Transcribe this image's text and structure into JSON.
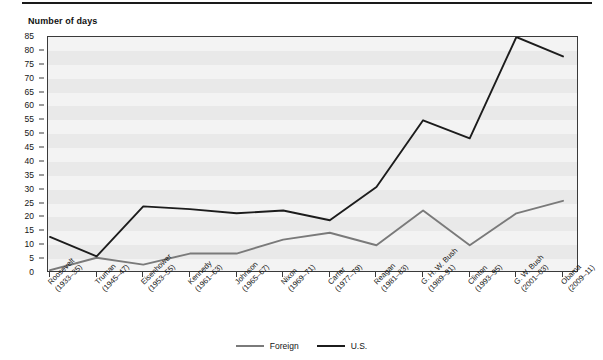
{
  "figure": {
    "y_axis_title": "Number of days"
  },
  "legend": {
    "items": [
      {
        "label": "Foreign",
        "color": "#7a7a7a"
      },
      {
        "label": "U.S.",
        "color": "#1c1c1c"
      }
    ]
  },
  "chart_data": {
    "type": "line",
    "title": "",
    "subtitle": "",
    "xlabel": "",
    "ylabel": "Number of days",
    "ylim": [
      0,
      85
    ],
    "ytick_step": 5,
    "yticks": [
      0,
      5,
      10,
      15,
      20,
      25,
      30,
      35,
      40,
      45,
      50,
      55,
      60,
      65,
      70,
      75,
      80,
      85
    ],
    "ytick_labels": [
      "0",
      "5",
      "10",
      "15",
      "20",
      "25",
      "30",
      "35",
      "40",
      "45",
      "50",
      "55",
      "60",
      "65",
      "70",
      "75",
      "80",
      "85"
    ],
    "grid": "horizontal-bands",
    "legend_position": "bottom-center",
    "categories": [
      "Roosevelt\n(1933–35)",
      "Truman\n(1945–47)",
      "Eisenhower\n(1953–55)",
      "Kennedy\n(1961–63)",
      "Johnson\n(1965–67)",
      "Nixon\n(1969–71)",
      "Carter\n(1977–79)",
      "Reagan\n(1981–83)",
      "G. H. W. Bush\n(1989–91)",
      "Clinton\n(1993–95)",
      "G. W. Bush\n(2001–03)",
      "Obama\n(2009–11)"
    ],
    "category_lines": [
      [
        "Roosevelt",
        "(1933–35)"
      ],
      [
        "Truman",
        "(1945–47)"
      ],
      [
        "Eisenhower",
        "(1953–55)"
      ],
      [
        "Kennedy",
        "(1961–63)"
      ],
      [
        "Johnson",
        "(1965–67)"
      ],
      [
        "Nixon",
        "(1969–71)"
      ],
      [
        "Carter",
        "(1977–79)"
      ],
      [
        "Reagan",
        "(1981–83)"
      ],
      [
        "G. H. W. Bush",
        "(1989–91)"
      ],
      [
        "Clinton",
        "(1993–95)"
      ],
      [
        "G. W. Bush",
        "(2001–03)"
      ],
      [
        "Obama",
        "(2009–11)"
      ]
    ],
    "series": [
      {
        "name": "Foreign",
        "color": "#7a7a7a",
        "values": [
          1,
          5.5,
          3,
          7,
          7,
          12,
          14.5,
          10,
          22.5,
          10,
          21.5,
          26
        ]
      },
      {
        "name": "U.S.",
        "color": "#1c1c1c",
        "values": [
          13,
          6,
          24,
          23,
          21.5,
          22.5,
          19,
          31,
          55,
          48.5,
          85,
          78
        ]
      }
    ]
  }
}
